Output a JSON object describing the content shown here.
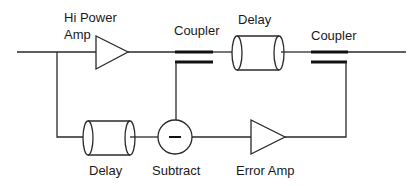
{
  "diagram": {
    "type": "feedforward-amplifier-block-diagram",
    "labels": {
      "hi_power_amp_line1": "Hi Power",
      "hi_power_amp_line2": "Amp",
      "coupler1": "Coupler",
      "delay_top": "Delay",
      "coupler2": "Coupler",
      "delay_bottom": "Delay",
      "subtract": "Subtract",
      "error_amp": "Error Amp"
    },
    "subtract_symbol": "−",
    "blocks": [
      {
        "id": "hi-power-amp",
        "kind": "amplifier"
      },
      {
        "id": "coupler-1",
        "kind": "coupler"
      },
      {
        "id": "delay-top",
        "kind": "delay-line"
      },
      {
        "id": "coupler-2",
        "kind": "coupler"
      },
      {
        "id": "delay-bottom",
        "kind": "delay-line"
      },
      {
        "id": "subtractor",
        "kind": "subtractor"
      },
      {
        "id": "error-amp",
        "kind": "amplifier"
      }
    ],
    "connections": [
      [
        "input",
        "hi-power-amp"
      ],
      [
        "hi-power-amp",
        "coupler-1"
      ],
      [
        "coupler-1",
        "delay-top"
      ],
      [
        "delay-top",
        "coupler-2"
      ],
      [
        "coupler-2",
        "output"
      ],
      [
        "input",
        "delay-bottom"
      ],
      [
        "delay-bottom",
        "subtractor"
      ],
      [
        "coupler-1",
        "subtractor"
      ],
      [
        "subtractor",
        "error-amp"
      ],
      [
        "error-amp",
        "coupler-2"
      ]
    ]
  }
}
